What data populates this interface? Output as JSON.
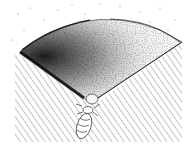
{
  "figure": {
    "kind": "pen-and-ink illustration",
    "colors": {
      "background": "#ffffff",
      "ink": "#111111",
      "hatch": "#8a8a8a",
      "stipple_light": "#bdbdbd"
    }
  }
}
